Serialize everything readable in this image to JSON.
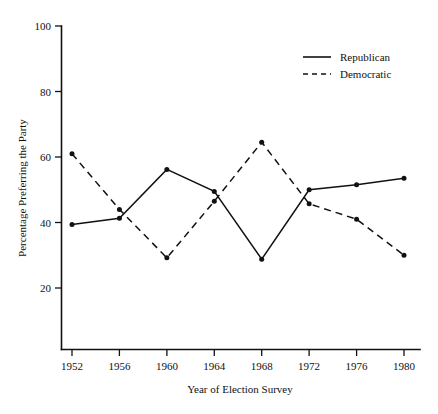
{
  "chart_data": {
    "type": "line",
    "title": "",
    "xlabel": "Year of Election Survey",
    "ylabel": "Percentage Preferring the Party",
    "categories": [
      "1952",
      "1956",
      "1960",
      "1964",
      "1968",
      "1972",
      "1976",
      "1980"
    ],
    "x": [
      1952,
      1956,
      1960,
      1964,
      1968,
      1972,
      1976,
      1980
    ],
    "xlim": [
      1952,
      1980
    ],
    "ylim": [
      0,
      100
    ],
    "yticks": [
      20,
      40,
      60,
      80,
      100
    ],
    "xticks": [
      "1952",
      "1956",
      "1960",
      "1964",
      "1968",
      "1972",
      "1976",
      "1980"
    ],
    "grid": false,
    "legend_position": "top-right",
    "series": [
      {
        "name": "Republican",
        "style": "solid",
        "color": "#111111",
        "marker": "filled-circle",
        "values": [
          39.4,
          41.3,
          56.2,
          49.5,
          28.8,
          50.0,
          51.5,
          53.5
        ]
      },
      {
        "name": "Democratic",
        "style": "dashed",
        "color": "#111111",
        "marker": "filled-circle",
        "values": [
          61.0,
          44.0,
          29.2,
          46.5,
          64.5,
          45.7,
          41.0,
          30.0
        ]
      }
    ]
  },
  "legend": {
    "entries": [
      {
        "label": "Republican",
        "style": "solid"
      },
      {
        "label": "Democratic",
        "style": "dashed"
      }
    ]
  },
  "axes": {
    "y_title": "Percentage Preferring the Party",
    "x_title": "Year of Election Survey",
    "y_tick_labels": [
      "100",
      "80",
      "60",
      "40",
      "20"
    ],
    "x_tick_labels": [
      "1952",
      "1956",
      "1960",
      "1964",
      "1968",
      "1972",
      "1976",
      "1980"
    ]
  }
}
